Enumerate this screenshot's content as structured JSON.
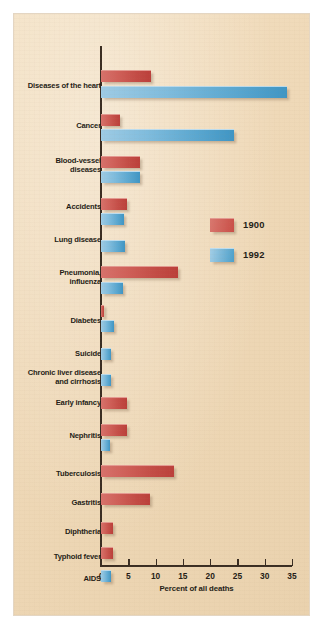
{
  "chart_data": {
    "type": "bar",
    "orientation": "horizontal",
    "title": "",
    "xlabel": "Percent of all deaths",
    "ylabel": "",
    "xlim": [
      0,
      35
    ],
    "xticks": [
      0,
      5,
      10,
      15,
      20,
      25,
      30,
      35
    ],
    "grid": false,
    "legend_position": "middle-right",
    "colors": {
      "1900": "#c74f48",
      "1992": "#5aa7d0",
      "background": "#efd9b8",
      "axis": "#3a2d22"
    },
    "categories": [
      "Diseases of the heart",
      "Cancer",
      "Blood-vessel\ndiseases",
      "Accidents",
      "Lung disease",
      "Pneumonia,\ninfluenza",
      "Diabetes",
      "Suicide",
      "Chronic liver disease\nand cirrhosis",
      "Early infancy",
      "Nephritis",
      "Tuberculosis",
      "Gastritis",
      "Diphtheria",
      "Typhoid fever",
      "AIDS"
    ],
    "series": [
      {
        "name": "1900",
        "color": "#c74f48",
        "values": [
          9.2,
          3.5,
          7.1,
          4.8,
          0,
          14.1,
          0.5,
          0,
          0,
          4.8,
          4.8,
          13.4,
          9.0,
          2.2,
          2.2,
          0
        ]
      },
      {
        "name": "1992",
        "color": "#5aa7d0",
        "values": [
          34.0,
          24.4,
          7.1,
          4.3,
          4.4,
          4.0,
          2.4,
          1.8,
          1.8,
          0,
          1.6,
          0,
          0,
          0,
          0,
          1.8
        ]
      }
    ]
  },
  "legend": {
    "items": [
      {
        "label": "1900",
        "swatch": "red"
      },
      {
        "label": "1992",
        "swatch": "blue"
      }
    ]
  },
  "axis": {
    "x_title": "Percent of all deaths",
    "tick_labels": [
      "0",
      "5",
      "10",
      "15",
      "20",
      "25",
      "30",
      "35"
    ]
  },
  "rows": [
    {
      "label": "Diseases of the heart",
      "label_lines": 1,
      "red": 9.2,
      "blue": 34.0,
      "label_y": 68,
      "red_y": 56,
      "blue_y": 72
    },
    {
      "label": "Cancer",
      "label_lines": 1,
      "red": 3.5,
      "blue": 24.4,
      "label_y": 108,
      "red_y": 100,
      "blue_y": 115
    },
    {
      "label": "Blood-vessel\ndiseases",
      "label_lines": 2,
      "red": 7.1,
      "blue": 7.1,
      "label_y": 143,
      "red_y": 142,
      "blue_y": 157
    },
    {
      "label": "Accidents",
      "label_lines": 1,
      "red": 4.8,
      "blue": 4.3,
      "label_y": 189,
      "red_y": 184,
      "blue_y": 199
    },
    {
      "label": "Lung disease",
      "label_lines": 1,
      "red": 0,
      "blue": 4.4,
      "label_y": 222,
      "red_y": 0,
      "blue_y": 226
    },
    {
      "label": "Pneumonia,\ninfluenza",
      "label_lines": 2,
      "red": 14.1,
      "blue": 4.0,
      "label_y": 255,
      "red_y": 252,
      "blue_y": 268
    },
    {
      "label": "Diabetes",
      "label_lines": 1,
      "red": 0.5,
      "blue": 2.4,
      "label_y": 303,
      "red_y": 291,
      "blue_y": 306
    },
    {
      "label": "Suicide",
      "label_lines": 1,
      "red": 0,
      "blue": 1.8,
      "label_y": 336,
      "red_y": 0,
      "blue_y": 334
    },
    {
      "label": "Chronic liver disease\nand cirrhosis",
      "label_lines": 2,
      "red": 0,
      "blue": 1.8,
      "label_y": 355,
      "red_y": 0,
      "blue_y": 360
    },
    {
      "label": "Early infancy",
      "label_lines": 1,
      "red": 4.8,
      "blue": 0,
      "label_y": 385,
      "red_y": 383,
      "blue_y": 0
    },
    {
      "label": "Nephritis",
      "label_lines": 1,
      "red": 4.8,
      "blue": 1.6,
      "label_y": 418,
      "red_y": 410,
      "blue_y": 425
    },
    {
      "label": "Tuberculosis",
      "label_lines": 1,
      "red": 13.4,
      "blue": 0,
      "label_y": 456,
      "red_y": 451,
      "blue_y": 0
    },
    {
      "label": "Gastritis",
      "label_lines": 1,
      "red": 9.0,
      "blue": 0,
      "label_y": 485,
      "red_y": 479,
      "blue_y": 0
    },
    {
      "label": "Diphtheria",
      "label_lines": 1,
      "red": 2.2,
      "blue": 0,
      "label_y": 514,
      "red_y": 508,
      "blue_y": 0
    },
    {
      "label": "Typhoid fever",
      "label_lines": 1,
      "red": 2.2,
      "blue": 0,
      "label_y": 539,
      "red_y": 533,
      "blue_y": 0
    },
    {
      "label": "AIDS",
      "label_lines": 1,
      "red": 0,
      "blue": 1.8,
      "label_y": 561,
      "red_y": 0,
      "blue_y": 556
    }
  ]
}
